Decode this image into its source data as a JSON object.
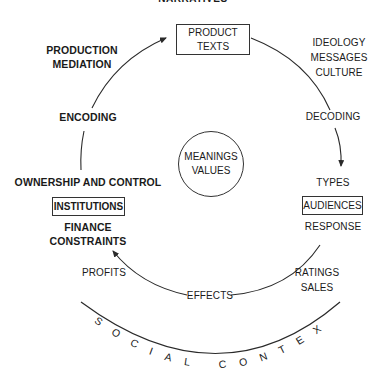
{
  "diagram": {
    "top_cut_label": "NARRATIVES",
    "nodes": {
      "product_texts": {
        "line1": "PRODUCT",
        "line2": "TEXTS"
      },
      "institutions": {
        "label": "INSTITUTIONS"
      },
      "audiences": {
        "label": "AUDIENCES"
      },
      "center": {
        "line1": "MEANINGS",
        "line2": "VALUES"
      }
    },
    "labels": {
      "production": "PRODUCTION",
      "mediation": "MEDIATION",
      "encoding": "ENCODING",
      "ownership": "OWNERSHIP AND CONTROL",
      "finance": "FINANCE",
      "constraints": "CONSTRAINTS",
      "profits": "PROFITS",
      "effects": "EFFECTS",
      "ratings": "RATINGS",
      "sales": "SALES",
      "response": "RESPONSE",
      "types": "TYPES",
      "decoding": "DECODING",
      "ideology": "IDEOLOGY",
      "messages": "MESSAGES",
      "culture": "CULTURE"
    },
    "outer_arc_text": "SOCIAL CONTEXT",
    "colors": {
      "line": "#2a2a2a",
      "text": "#1a1a1a",
      "background": "#ffffff"
    }
  }
}
